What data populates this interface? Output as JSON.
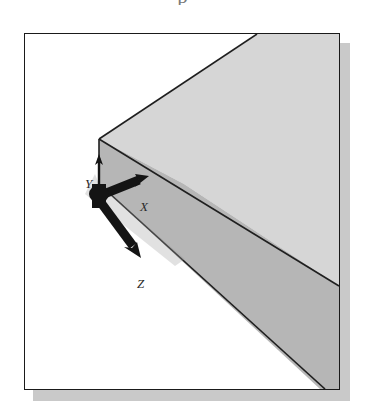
{
  "figure": {
    "caption_remnant": "p",
    "frame": {
      "x": 24,
      "y": 33,
      "width": 316,
      "height": 357,
      "border_color": "#1a1a1a",
      "background_color": "#ffffff",
      "shadow_color": "#c9c9c9",
      "shadow_offset_x": 9,
      "shadow_offset_y": 10
    },
    "solid": {
      "name": "rectangular-block",
      "projection": "isometric",
      "top_face_color": "#d6d6d6",
      "front_face_color": "#b6b6b6",
      "edge_color": "#1f1f1f",
      "corner_vertex": {
        "x": 74,
        "y": 105
      },
      "faces": [
        {
          "name": "top-face",
          "shade": "light",
          "color": "#d6d6d6"
        },
        {
          "name": "front-face",
          "shade": "medium",
          "color": "#b6b6b6"
        }
      ]
    },
    "coordinate_triad": {
      "name": "origin-triad",
      "origin": {
        "x": 74,
        "y": 150
      },
      "marker_color": "#141414",
      "axes": [
        {
          "label": "Y",
          "direction": "up",
          "tip_x": 74,
          "tip_y": 152
        },
        {
          "label": "X",
          "direction": "up-right",
          "tip_x": 125,
          "tip_y": 175
        },
        {
          "label": "Z",
          "direction": "down-right",
          "tip_x": 120,
          "tip_y": 248
        }
      ]
    }
  }
}
